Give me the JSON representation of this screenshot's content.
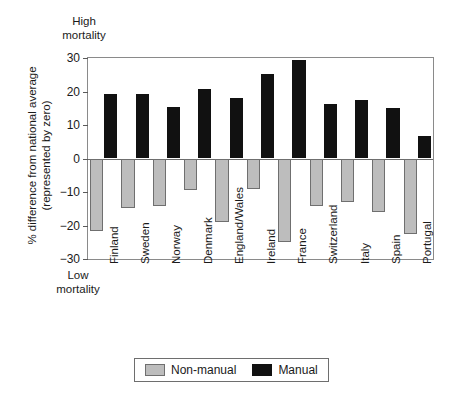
{
  "annotations": {
    "high_mortality": "High\nmortality",
    "low_mortality": "Low\nmortality"
  },
  "chart_data": {
    "type": "bar",
    "title": "",
    "subtitle": "",
    "xlabel": "",
    "ylabel": "% difference from national average\n(represented by zero)",
    "ylim": [
      -30,
      30
    ],
    "yticks": [
      30,
      20,
      10,
      0,
      -10,
      -20,
      -30
    ],
    "ytick_labels": [
      "30",
      "20",
      "10",
      "0",
      "−10",
      "−20",
      "−30"
    ],
    "grid": false,
    "legend_position": "bottom-center",
    "categories": [
      "Finland",
      "Sweden",
      "Norway",
      "Denmark",
      "England/Wales",
      "Ireland",
      "France",
      "Switzerland",
      "Italy",
      "Spain",
      "Portugal"
    ],
    "series": [
      {
        "name": "Non-manual",
        "color": "#bdbdbd",
        "values": [
          -21.5,
          -14.8,
          -14.2,
          -9.5,
          -19.0,
          -9.2,
          -24.8,
          -14.1,
          -13.0,
          -16.0,
          -22.6
        ]
      },
      {
        "name": "Manual",
        "color": "#111111",
        "values": [
          19.2,
          19.2,
          15.5,
          20.8,
          18.0,
          25.2,
          29.5,
          16.3,
          17.4,
          15.2,
          6.6
        ]
      }
    ],
    "annotations": [
      "High mortality",
      "Low mortality"
    ]
  },
  "legend": {
    "items": [
      {
        "label": "Non-manual",
        "swatch": "nonmanual"
      },
      {
        "label": "Manual",
        "swatch": "manual"
      }
    ]
  }
}
